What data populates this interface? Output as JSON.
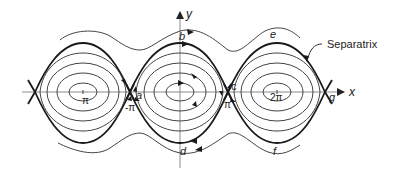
{
  "figure": {
    "axes": {
      "x_label": "x",
      "y_label": "y"
    },
    "tick_labels": {
      "neg_pi": "-π",
      "pi_left": "π",
      "pi_right": "π",
      "two_pi": "2π"
    },
    "point_labels": {
      "a": "a",
      "b": "b",
      "c": "c",
      "d": "d",
      "e": "e",
      "f": "f",
      "g": "g"
    },
    "annotation": {
      "separatrix": "Separatrix"
    },
    "colors": {
      "curve": "#333333",
      "separatrix": "#1a1a1a",
      "axis": "#888888",
      "background": "#ffffff"
    }
  }
}
